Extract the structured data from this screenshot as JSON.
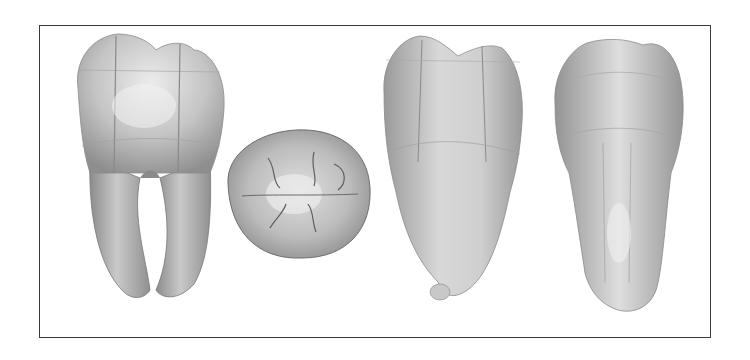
{
  "figure": {
    "background": "#ffffff",
    "border_color": "#3a3a3a",
    "tooth_fill_light": "#e4e4e4",
    "tooth_fill_mid": "#bdbdbd",
    "tooth_fill_dark": "#8a8a8a",
    "views": [
      {
        "id": "buccal-two-root",
        "label": "buccal view with two roots",
        "x": 72,
        "y": 34,
        "w": 155,
        "h": 266
      },
      {
        "id": "occlusal",
        "label": "occlusal view",
        "x": 222,
        "y": 128,
        "w": 148,
        "h": 131
      },
      {
        "id": "mesial",
        "label": "proximal view, fused root",
        "x": 382,
        "y": 36,
        "w": 141,
        "h": 266
      },
      {
        "id": "distal",
        "label": "proximal view, conical root",
        "x": 551,
        "y": 37,
        "w": 133,
        "h": 277
      }
    ]
  }
}
